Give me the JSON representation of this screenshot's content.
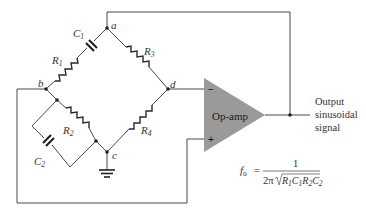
{
  "diagram": {
    "nodes": {
      "a": "a",
      "b": "b",
      "c": "c",
      "d": "d"
    },
    "components": {
      "R1": {
        "name": "R",
        "sub": "1"
      },
      "R2": {
        "name": "R",
        "sub": "2"
      },
      "R3": {
        "name": "R",
        "sub": "3"
      },
      "R4": {
        "name": "R",
        "sub": "4"
      },
      "C1": {
        "name": "C",
        "sub": "1"
      },
      "C2": {
        "name": "C",
        "sub": "2"
      }
    },
    "opamp": {
      "label": "Op-amp",
      "inverting": "−",
      "noninverting": "+"
    },
    "output": {
      "line1": "Output",
      "line2": "sinusoidal",
      "line3": "signal"
    },
    "formula": {
      "lhs": "f",
      "lhs_sub": "o",
      "equals": "=",
      "numerator": "1",
      "denominator_prefix": "2π",
      "denominator_radicand": "R1C1R2C2"
    }
  }
}
